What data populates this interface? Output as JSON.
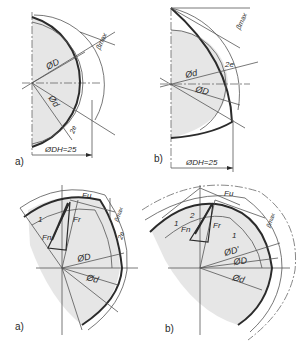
{
  "figure": {
    "top_left": {
      "panel_label": "a)",
      "labels": {
        "beta": "βmax",
        "D": "ØD",
        "d": "Ød",
        "e": "2e",
        "DH": "ØDH=25"
      }
    },
    "top_right": {
      "panel_label": "b)",
      "labels": {
        "beta": "βmax",
        "e": "2e",
        "d": "Ød",
        "D": "ØD",
        "DH": "ØDH=25"
      }
    },
    "bottom_left": {
      "panel_label": "a)",
      "labels": {
        "Fu": "Fu",
        "Fr": "Fr",
        "Fn": "Fn",
        "one": "1",
        "beta": "βmax",
        "e": "2e",
        "D": "ØD",
        "d": "Ød"
      }
    },
    "bottom_right": {
      "panel_label": "b)",
      "labels": {
        "Fu": "Fu",
        "Fr": "Fr",
        "Fn": "Fn",
        "one_a": "1",
        "two": "2",
        "one_b": "1",
        "beta": "βmax",
        "Dprime": "ØD'",
        "D": "ØD",
        "d": "Ød"
      }
    },
    "colors": {
      "line": "#2b2b2b",
      "shade": "#e6e6e6",
      "background": "#ffffff"
    }
  }
}
